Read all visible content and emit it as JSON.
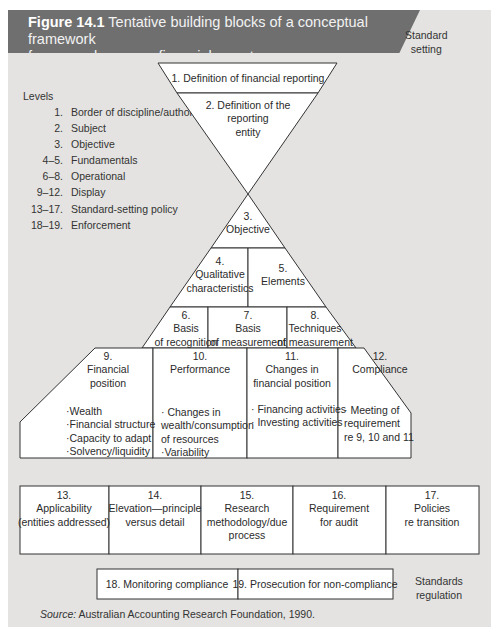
{
  "figure": {
    "number": "Figure 14.1",
    "title": "Tentative building blocks of a conceptual framework for general-purpose financial reports",
    "title_line1": "Tentative building blocks of a conceptual framework",
    "title_line2": "for general-purpose financial reports",
    "header_color": "#6f6f6f",
    "page_color": "#e4e3e1"
  },
  "side_labels": {
    "standard_setting": [
      "Standard",
      "setting"
    ],
    "standards_regulation": [
      "Standards",
      "regulation"
    ]
  },
  "levels": {
    "title": "Levels",
    "items": [
      {
        "num": "1.",
        "label": "Border of discipline/authority"
      },
      {
        "num": "2.",
        "label": "Subject"
      },
      {
        "num": "3.",
        "label": "Objective"
      },
      {
        "num": "4–5.",
        "label": "Fundamentals"
      },
      {
        "num": "6–8.",
        "label": "Operational"
      },
      {
        "num": "9–12.",
        "label": "Display"
      },
      {
        "num": "13–17.",
        "label": "Standard-setting policy"
      },
      {
        "num": "18–19.",
        "label": "Enforcement"
      }
    ]
  },
  "blocks": {
    "b1": {
      "lines": [
        "1. Definition of financial reporting"
      ]
    },
    "b2": {
      "lines": [
        "2. Definition of the",
        "reporting",
        "entity"
      ]
    },
    "b3": {
      "lines": [
        "3.",
        "Objective"
      ]
    },
    "b4": {
      "lines": [
        "4.",
        "Qualitative",
        "characteristics"
      ]
    },
    "b5": {
      "lines": [
        "5.",
        "Elements"
      ]
    },
    "b6": {
      "lines": [
        "6.",
        "Basis",
        "of recognition"
      ]
    },
    "b7": {
      "lines": [
        "7.",
        "Basis",
        "of measurement"
      ]
    },
    "b8": {
      "lines": [
        "8.",
        "Techniques",
        "of measurement"
      ]
    },
    "b9": {
      "lines": [
        "9.",
        "Financial",
        "position"
      ],
      "bullets": [
        "·Wealth",
        "·Financial structure",
        "·Capacity to adapt",
        "·Solvency/liquidity"
      ]
    },
    "b10": {
      "lines": [
        "10.",
        "Performance"
      ],
      "bullets": [
        "· Changes in",
        "wealth/consumption",
        "of resources",
        "·Variability"
      ]
    },
    "b11": {
      "lines": [
        "11.",
        "Changes in",
        "financial position"
      ],
      "bullets": [
        "· Financing activities",
        "· Investing activities"
      ]
    },
    "b12": {
      "lines": [
        "12.",
        "Compliance"
      ],
      "bullets": [
        "· Meeting of",
        "requirement",
        "re 9, 10 and 11"
      ]
    },
    "b13": {
      "lines": [
        "13.",
        "Applicability",
        "(entities addressed)"
      ]
    },
    "b14": {
      "lines": [
        "14.",
        "Elevation—principle",
        "versus detail"
      ]
    },
    "b15": {
      "lines": [
        "15.",
        "Research",
        "methodology/due",
        "process"
      ]
    },
    "b16": {
      "lines": [
        "16.",
        "Requirement",
        "for audit"
      ]
    },
    "b17": {
      "lines": [
        "17.",
        "Policies",
        "re transition"
      ]
    },
    "b18": {
      "lines": [
        "18. Monitoring compliance"
      ]
    },
    "b19": {
      "lines": [
        "19. Prosecution for non-compliance"
      ]
    }
  },
  "source": {
    "label": "Source:",
    "text": " Australian Accounting Research Foundation, 1990."
  }
}
